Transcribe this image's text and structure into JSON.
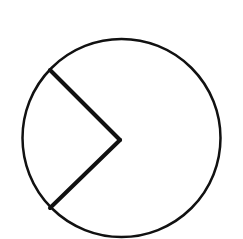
{
  "diagram": {
    "type": "circle-with-sector",
    "stroke_color": "#111111",
    "background_color": "#ffffff",
    "circle": {
      "cx": 121.5,
      "cy": 138,
      "r": 99,
      "stroke_width": 2.5
    },
    "radii": [
      {
        "x1": 120,
        "y1": 140,
        "x2": 50,
        "y2": 70,
        "stroke_width": 4
      },
      {
        "x1": 120,
        "y1": 140,
        "x2": 50,
        "y2": 208,
        "stroke_width": 4
      }
    ]
  }
}
